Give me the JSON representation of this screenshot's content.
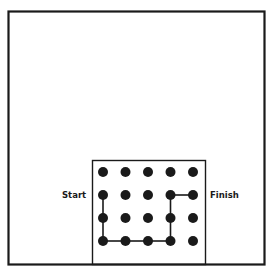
{
  "diagram": {
    "labels": {
      "start": "Start",
      "finish": "Finish"
    },
    "grid": {
      "rows": 4,
      "cols": 5
    },
    "path": [
      [
        1,
        0
      ],
      [
        2,
        0
      ],
      [
        3,
        0
      ],
      [
        3,
        1
      ],
      [
        3,
        2
      ],
      [
        3,
        3
      ],
      [
        2,
        3
      ],
      [
        1,
        3
      ],
      [
        1,
        4
      ]
    ],
    "colors": {
      "ink": "#1a1a1a",
      "background": "#ffffff"
    }
  }
}
